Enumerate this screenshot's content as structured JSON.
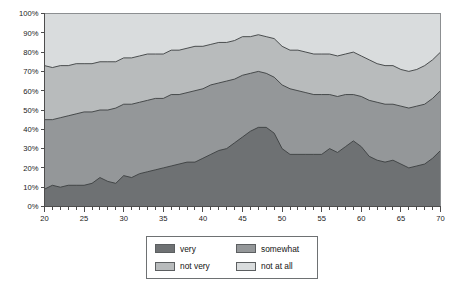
{
  "chart_data": {
    "type": "area",
    "stacked": true,
    "title": "",
    "subtitle": "",
    "xlabel": "",
    "ylabel": "",
    "xlim": [
      20,
      70
    ],
    "ylim": [
      0,
      100
    ],
    "grid": false,
    "legend_position": "bottom",
    "x_tick_labels": [
      "20",
      "25",
      "30",
      "35",
      "40",
      "45",
      "50",
      "55",
      "60",
      "65",
      "70"
    ],
    "x_tick_values": [
      20,
      25,
      30,
      35,
      40,
      45,
      50,
      55,
      60,
      65,
      70
    ],
    "x_minor_step": 1,
    "y_tick_labels": [
      "0%",
      "10%",
      "20%",
      "30%",
      "40%",
      "50%",
      "60%",
      "70%",
      "80%",
      "90%",
      "100%"
    ],
    "y_tick_values": [
      0,
      10,
      20,
      30,
      40,
      50,
      60,
      70,
      80,
      90,
      100
    ],
    "x": [
      20,
      21,
      22,
      23,
      24,
      25,
      26,
      27,
      28,
      29,
      30,
      31,
      32,
      33,
      34,
      35,
      36,
      37,
      38,
      39,
      40,
      41,
      42,
      43,
      44,
      45,
      46,
      47,
      48,
      49,
      50,
      51,
      52,
      53,
      54,
      55,
      56,
      57,
      58,
      59,
      60,
      61,
      62,
      63,
      64,
      65,
      66,
      67,
      68,
      69,
      70
    ],
    "series": [
      {
        "name": "very",
        "color": "#6e7173",
        "values": [
          9,
          11,
          10,
          11,
          11,
          11,
          12,
          15,
          13,
          12,
          16,
          15,
          17,
          18,
          19,
          20,
          21,
          22,
          23,
          23,
          25,
          27,
          29,
          30,
          33,
          36,
          39,
          41,
          41,
          38,
          30,
          27,
          27,
          27,
          27,
          27,
          30,
          28,
          31,
          34,
          31,
          26,
          24,
          23,
          24,
          22,
          20,
          21,
          22,
          25,
          29
        ]
      },
      {
        "name": "somewhat",
        "color": "#949799",
        "values": [
          36,
          34,
          36,
          36,
          37,
          38,
          37,
          35,
          37,
          39,
          37,
          38,
          37,
          37,
          37,
          36,
          37,
          36,
          36,
          37,
          36,
          36,
          35,
          35,
          33,
          32,
          30,
          29,
          28,
          29,
          33,
          34,
          33,
          32,
          31,
          31,
          28,
          29,
          27,
          24,
          26,
          29,
          30,
          30,
          29,
          30,
          31,
          31,
          31,
          31,
          31
        ]
      },
      {
        "name": "not very",
        "color": "#b8bbbc",
        "values": [
          28,
          27,
          27,
          26,
          26,
          25,
          25,
          25,
          25,
          24,
          24,
          24,
          24,
          24,
          23,
          23,
          23,
          23,
          23,
          23,
          22,
          21,
          21,
          20,
          20,
          20,
          19,
          19,
          19,
          20,
          20,
          20,
          21,
          21,
          21,
          21,
          21,
          21,
          21,
          22,
          21,
          21,
          20,
          20,
          20,
          19,
          19,
          19,
          20,
          20,
          20
        ]
      },
      {
        "name": "not at all",
        "color": "#d9dcdd",
        "values": [
          27,
          28,
          27,
          27,
          26,
          26,
          26,
          25,
          25,
          25,
          23,
          23,
          22,
          21,
          21,
          21,
          19,
          19,
          18,
          17,
          17,
          16,
          15,
          15,
          14,
          12,
          12,
          11,
          12,
          13,
          17,
          19,
          19,
          20,
          21,
          21,
          21,
          22,
          21,
          20,
          22,
          24,
          26,
          27,
          27,
          29,
          30,
          29,
          27,
          24,
          20
        ]
      }
    ]
  },
  "legend": {
    "items": [
      {
        "label": "very",
        "color": "#6e7173"
      },
      {
        "label": "somewhat",
        "color": "#949799"
      },
      {
        "label": "not very",
        "color": "#b8bbbc"
      },
      {
        "label": "not at all",
        "color": "#d9dcdd"
      }
    ]
  }
}
